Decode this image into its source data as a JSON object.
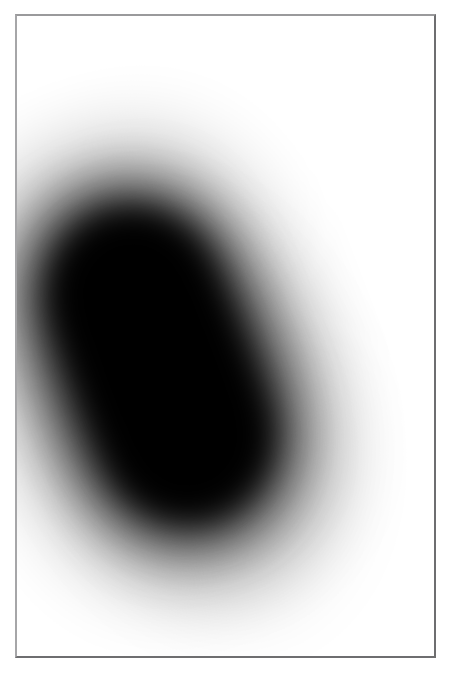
{
  "figure": {
    "title": "",
    "caption": "",
    "panel_background": "#ffffff",
    "frame_color": "#6e6e70",
    "blob_color": "#000000"
  },
  "chart_data": {
    "type": "heatmap",
    "title": "",
    "subtitle": "",
    "xlabel": "",
    "ylabel": "",
    "xlim": [
      0,
      421
    ],
    "ylim": [
      0,
      644
    ],
    "grid": false,
    "legend": null,
    "colormap": "grayscale",
    "colormap_min_color": "#ffffff",
    "colormap_max_color": "#000000",
    "value_range": [
      0,
      1
    ],
    "tick_labels_x": [],
    "tick_labels_y": [],
    "annotations": [],
    "regions": [
      {
        "name": "primary-capsule",
        "shape": "stadium",
        "center_x": 186,
        "center_y": 350,
        "major_axis": 310,
        "minor_axis": 156,
        "rotation_deg": -21,
        "peak_value": 1.0,
        "blur_sigma": 34
      }
    ],
    "x": [
      20,
      60,
      100,
      140,
      180,
      220,
      260,
      300,
      340,
      380,
      420
    ],
    "series": [
      {
        "name": "row_y=190",
        "values": [
          0.0,
          0.03,
          0.12,
          0.45,
          0.88,
          1.0,
          1.0,
          1.0,
          0.96,
          0.42,
          0.06
        ]
      },
      {
        "name": "row_y=350",
        "values": [
          0.1,
          0.38,
          0.82,
          1.0,
          1.0,
          1.0,
          1.0,
          0.9,
          0.4,
          0.1,
          0.02
        ]
      },
      {
        "name": "row_y=500",
        "values": [
          0.22,
          0.62,
          1.0,
          1.0,
          1.0,
          1.0,
          0.92,
          0.5,
          0.16,
          0.04,
          0.01
        ]
      },
      {
        "name": "row_y=620",
        "values": [
          0.04,
          0.09,
          0.16,
          0.2,
          0.21,
          0.19,
          0.15,
          0.1,
          0.06,
          0.03,
          0.01
        ]
      }
    ]
  }
}
